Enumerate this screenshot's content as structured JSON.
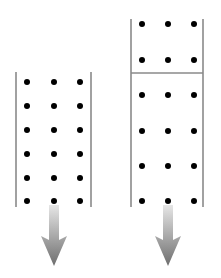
{
  "diagram": {
    "background": "#ffffff",
    "line_color": "#8a8a8a",
    "dot_color": "#000000",
    "dot_radius": 3,
    "arrow_colors": {
      "top": "#e6e6e6",
      "bottom": "#6e6e6e"
    },
    "columns": [
      {
        "name": "left-column",
        "x_left": 16,
        "x_right": 91,
        "y_top": 72,
        "y_bottom": 207,
        "dividers": [],
        "dot_xs": [
          27,
          54,
          80
        ],
        "dot_ys": [
          82,
          106,
          130,
          154,
          178,
          201
        ],
        "arrow": {
          "cx": 54,
          "y_start": 205,
          "shaft_end": 240,
          "tip": 266,
          "shaft_half": 5,
          "head_half": 13
        }
      },
      {
        "name": "right-column",
        "x_left": 131,
        "x_right": 203,
        "y_top": 19,
        "y_bottom": 207,
        "dividers": [
          73
        ],
        "dot_xs": [
          142,
          168,
          194
        ],
        "dot_ys": [
          24,
          60,
          95,
          131,
          166,
          201
        ],
        "arrow": {
          "cx": 168,
          "y_start": 205,
          "shaft_end": 240,
          "tip": 266,
          "shaft_half": 5,
          "head_half": 13
        }
      }
    ]
  }
}
